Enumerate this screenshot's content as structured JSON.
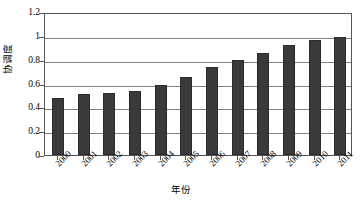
{
  "chart_data": {
    "type": "bar",
    "title": "",
    "xlabel": "年份",
    "ylabel": "协调度",
    "categories": [
      "2000",
      "2001",
      "2002",
      "2003",
      "2004",
      "2005",
      "2006",
      "2007",
      "2008",
      "2009",
      "2010",
      "2011"
    ],
    "values": [
      0.48,
      0.51,
      0.52,
      0.54,
      0.59,
      0.655,
      0.735,
      0.795,
      0.855,
      0.92,
      0.965,
      0.99
    ],
    "ylim": [
      0,
      1.2
    ],
    "ytick_labels": [
      "0",
      "0.2",
      "0.4",
      "0.6",
      "0.8",
      "1",
      "1.2"
    ],
    "ytick_values": [
      0,
      0.2,
      0.4,
      0.6,
      0.8,
      1,
      1.2
    ],
    "grid": true,
    "legend": "none",
    "bar_color": "#3a3a3a",
    "grid_color": "#808080",
    "frame_color": "#555555"
  }
}
